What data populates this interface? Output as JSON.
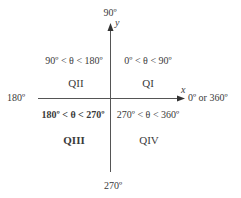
{
  "diagram": {
    "axes": {
      "y_axis_label": "y",
      "x_axis_label": "x",
      "top_angle": "90º",
      "left_angle": "180º",
      "right_angle": "0º or 360º",
      "bottom_angle": "270º"
    },
    "quadrants": [
      {
        "id": "QI",
        "name": "QI",
        "range": "0º < θ < 90º",
        "emphasis": "normal"
      },
      {
        "id": "QII",
        "name": "QII",
        "range": "90º < θ < 180º",
        "emphasis": "normal"
      },
      {
        "id": "QIII",
        "name": "QIII",
        "range": "180º < θ < 270º",
        "emphasis": "bold"
      },
      {
        "id": "QIV",
        "name": "QIV",
        "range": "270º < θ < 360º",
        "emphasis": "normal"
      }
    ],
    "colors": {
      "line": "#555555",
      "text": "#3a3a3a",
      "background": "#ffffff"
    }
  }
}
